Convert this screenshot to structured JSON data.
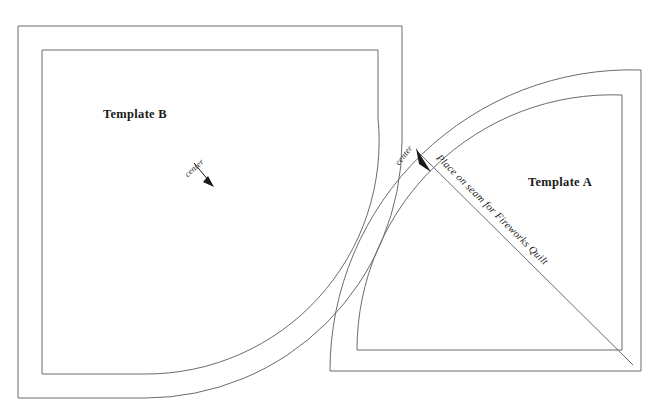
{
  "page": {
    "background_color": "#ffffff",
    "line_color": "#6b6b6b",
    "text_color": "#1a1a1a",
    "width": 669,
    "height": 411
  },
  "templates": [
    {
      "id": "template-b",
      "label": "Template B",
      "label_x": 135,
      "label_y": 118,
      "shape": "rectangle-with-concave-quarter-arc-cutout",
      "annotation": {
        "text": "center",
        "text_x": 196,
        "text_y": 170,
        "rotation": -42,
        "arrow_from_x": 198,
        "arrow_from_y": 163,
        "arrow_to_x": 213,
        "arrow_to_y": 184
      },
      "outer_path": "M 18 26 L 402 26 L 402 141 A 257 257 0 0 1 145 398 L 18 398 Z",
      "inner_path": "M 42 50 L 378 50 L 378 118 A 233 233 0 0 1 145 374 L 42 374 Z"
    },
    {
      "id": "template-a",
      "label": "Template A",
      "label_x": 560,
      "label_y": 186,
      "shape": "quarter-circle-with-inner-offset-and-diagonal-seam-line",
      "annotation": {
        "text": "center",
        "text_x": 406,
        "text_y": 155,
        "rotation": -50,
        "arrow_from_x": 438,
        "arrow_from_y": 176,
        "arrow_to_x": 418,
        "arrow_to_y": 155
      },
      "seam_annotation": {
        "text": "Place on seam for Fireworks Quilt",
        "text_x": 490,
        "text_y": 212,
        "rotation": 49
      },
      "outer_path": "M 330 371 L 641 371 L 641 70 A 301 301 0 0 0 330 371 Z",
      "inner_path": "M 357 350 L 622 350 L 622 95 A 255 255 0 0 0 357 350 Z",
      "diagonal_path": "M 633 365 L 418 152"
    }
  ],
  "annotations": {
    "center_text": "center",
    "seam_text": "Place on seam for Fireworks Quilt"
  }
}
